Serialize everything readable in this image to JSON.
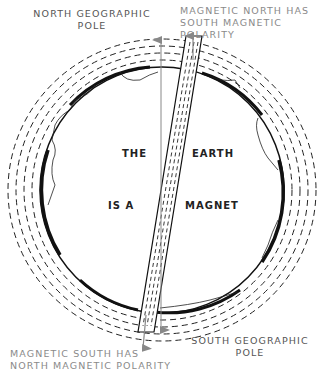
{
  "diagram": {
    "labels": {
      "north_geographic": [
        "NORTH GEOGRAPHIC",
        "POLE"
      ],
      "magnetic_north": [
        "MAGNETIC NORTH HAS",
        "SOUTH MAGNETIC",
        "POLARITY"
      ],
      "magnetic_south": [
        "MAGNETIC SOUTH HAS",
        "NORTH MAGNETIC POLARITY"
      ],
      "south_geographic": [
        "SOUTH GEOGRAPHIC",
        "POLE"
      ]
    },
    "inner_text": {
      "w1": "THE",
      "w2": "EARTH",
      "w3": "IS A",
      "w4": "MAGNET"
    },
    "colors": {
      "outline": "#111111",
      "field_lines": "#222222",
      "arrow": "#888888",
      "label_dark": "#555555",
      "label_light": "#8a8a8a"
    }
  }
}
